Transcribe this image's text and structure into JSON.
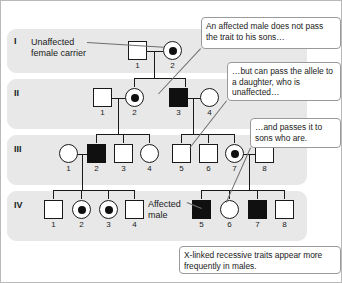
{
  "figure": {
    "type": "pedigree-chart",
    "topic": "X-linked recessive inheritance",
    "generations": [
      {
        "label": "I"
      },
      {
        "label": "II"
      },
      {
        "label": "III"
      },
      {
        "label": "IV"
      }
    ]
  },
  "labels": {
    "unaffected_female_carrier": "Unaffected\nfemale carrier",
    "unaffected_female_carrier_line1": "Unaffected",
    "unaffected_female_carrier_line2": "female carrier",
    "affected_male_line1": "Affected",
    "affected_male_line2": "male"
  },
  "callouts": [
    {
      "id": "callout-sons",
      "text": "An affected male does not pass the trait to his sons…"
    },
    {
      "id": "callout-daughter",
      "text": "…but can pass the allele to a daughter, who is unaffected…"
    },
    {
      "id": "callout-grandsons",
      "text": "…and passes it to sons who are."
    },
    {
      "id": "callout-frequency",
      "text": "X-linked recessive traits appear more frequently in males."
    }
  ],
  "individuals": [
    {
      "gen": "I",
      "num": "1",
      "sex": "male",
      "status": "unaffected"
    },
    {
      "gen": "I",
      "num": "2",
      "sex": "female",
      "status": "carrier"
    },
    {
      "gen": "II",
      "num": "1",
      "sex": "male",
      "status": "unaffected"
    },
    {
      "gen": "II",
      "num": "2",
      "sex": "female",
      "status": "carrier"
    },
    {
      "gen": "II",
      "num": "3",
      "sex": "male",
      "status": "affected"
    },
    {
      "gen": "II",
      "num": "4",
      "sex": "female",
      "status": "unaffected"
    },
    {
      "gen": "III",
      "num": "1",
      "sex": "female",
      "status": "unaffected"
    },
    {
      "gen": "III",
      "num": "2",
      "sex": "male",
      "status": "affected"
    },
    {
      "gen": "III",
      "num": "3",
      "sex": "male",
      "status": "unaffected"
    },
    {
      "gen": "III",
      "num": "4",
      "sex": "female",
      "status": "unaffected"
    },
    {
      "gen": "III",
      "num": "5",
      "sex": "male",
      "status": "unaffected"
    },
    {
      "gen": "III",
      "num": "6",
      "sex": "male",
      "status": "unaffected"
    },
    {
      "gen": "III",
      "num": "7",
      "sex": "female",
      "status": "carrier"
    },
    {
      "gen": "III",
      "num": "8",
      "sex": "male",
      "status": "unaffected"
    },
    {
      "gen": "IV",
      "num": "1",
      "sex": "male",
      "status": "unaffected"
    },
    {
      "gen": "IV",
      "num": "2",
      "sex": "female",
      "status": "carrier"
    },
    {
      "gen": "IV",
      "num": "3",
      "sex": "female",
      "status": "carrier"
    },
    {
      "gen": "IV",
      "num": "4",
      "sex": "male",
      "status": "unaffected"
    },
    {
      "gen": "IV",
      "num": "5",
      "sex": "male",
      "status": "affected"
    },
    {
      "gen": "IV",
      "num": "6",
      "sex": "female",
      "status": "unaffected"
    },
    {
      "gen": "IV",
      "num": "7",
      "sex": "male",
      "status": "affected"
    },
    {
      "gen": "IV",
      "num": "8",
      "sex": "male",
      "status": "unaffected"
    }
  ],
  "colors": {
    "band": "#e8e8e8",
    "symbol_stroke": "#1a1a1a",
    "affected_fill": "#101010",
    "unaffected_fill": "#ffffff",
    "callout_border": "#9a9a9a",
    "leader": "#6e6e6e",
    "background": "#ffffff"
  }
}
